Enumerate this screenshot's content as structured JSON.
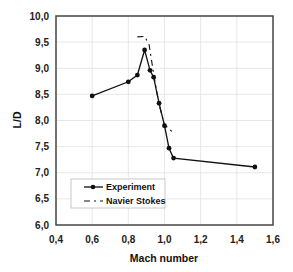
{
  "chart_data": {
    "type": "line",
    "title": "",
    "xlabel": "Mach number",
    "ylabel": "L/D",
    "xlim": [
      0.4,
      1.6
    ],
    "ylim": [
      6.0,
      10.0
    ],
    "x_ticks": [
      "0,4",
      "0,6",
      "0,8",
      "1,0",
      "1,2",
      "1,4",
      "1,6"
    ],
    "y_ticks": [
      "6,0",
      "6,5",
      "7,0",
      "7,5",
      "8,0",
      "8,5",
      "9,0",
      "9,5",
      "10,0"
    ],
    "grid": true,
    "legend_position": "lower left",
    "series": [
      {
        "name": "Experiment",
        "style": "solid line with circle markers",
        "color": "#111111",
        "x": [
          0.6,
          0.8,
          0.85,
          0.89,
          0.92,
          0.94,
          0.97,
          1.0,
          1.025,
          1.05,
          1.5
        ],
        "y": [
          8.47,
          8.74,
          8.87,
          9.35,
          8.96,
          8.83,
          8.33,
          7.9,
          7.47,
          7.28,
          7.11
        ]
      },
      {
        "name": "Navier Stokes",
        "style": "dash-dot line",
        "color": "#111111",
        "x": [
          0.85,
          0.89,
          0.915,
          0.94,
          0.97,
          1.0,
          1.05
        ],
        "y": [
          9.6,
          9.61,
          9.45,
          8.9,
          8.3,
          7.92,
          7.76
        ]
      }
    ]
  }
}
